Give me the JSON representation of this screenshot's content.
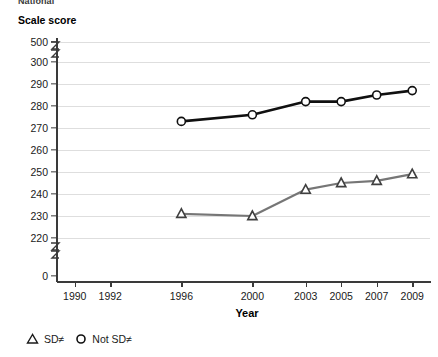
{
  "clipped_heading": "National",
  "axis": {
    "y_title": "Scale score",
    "x_title": "Year",
    "y_ticks": [
      500,
      300,
      290,
      280,
      270,
      260,
      250,
      240,
      230,
      220,
      0
    ],
    "y_breaks": [
      "between-500-and-300",
      "between-220-and-0"
    ],
    "x_ticks": [
      1990,
      1992,
      1996,
      2000,
      2003,
      2005,
      2007,
      2009
    ]
  },
  "legend": {
    "items": [
      {
        "marker": "triangle",
        "label": "SD≠"
      },
      {
        "marker": "circle",
        "label": "Not SD≠"
      }
    ]
  },
  "colors": {
    "not_sd_line": "#101010",
    "sd_line": "#767676",
    "grid": "#dedede",
    "axis": "#3a3a3a"
  },
  "chart_data": {
    "type": "line",
    "title": "Scale score",
    "xlabel": "Year",
    "ylabel": "Scale score",
    "x": [
      1990,
      1992,
      1996,
      2000,
      2003,
      2005,
      2007,
      2009
    ],
    "xlim": [
      1989,
      2010
    ],
    "ylim": [
      220,
      300
    ],
    "ytick_labels": [
      "500",
      "300",
      "290",
      "280",
      "270",
      "260",
      "250",
      "240",
      "230",
      "220",
      "0"
    ],
    "axis_break": true,
    "grid": true,
    "legend_position": "bottom-left",
    "series": [
      {
        "name": "Not SD≠",
        "marker": "circle",
        "color": "#101010",
        "x": [
          1996,
          2000,
          2003,
          2005,
          2007,
          2009
        ],
        "values": [
          273,
          276,
          282,
          282,
          285,
          287
        ]
      },
      {
        "name": "SD≠",
        "marker": "triangle",
        "color": "#767676",
        "x": [
          1996,
          2000,
          2003,
          2005,
          2007,
          2009
        ],
        "values": [
          231,
          230,
          242,
          245,
          246,
          249
        ]
      }
    ]
  }
}
